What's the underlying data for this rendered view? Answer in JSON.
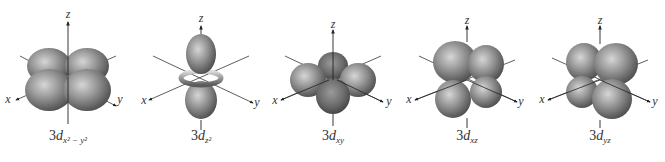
{
  "figure": {
    "colors": {
      "lobe_light": "#c4c4c4",
      "lobe_mid": "#8f8f8f",
      "lobe_dark": "#5a5a5a",
      "axis": "#222222",
      "text": "#333333"
    },
    "orbitals": [
      {
        "id": "dx2-y2",
        "prefix": "3",
        "letter": "d",
        "subscript": "x² − y²",
        "axes": {
          "x": "x",
          "y": "y",
          "z": "z"
        }
      },
      {
        "id": "dz2",
        "prefix": "3",
        "letter": "d",
        "subscript": "z²",
        "axes": {
          "x": "x",
          "y": "y",
          "z": "z"
        }
      },
      {
        "id": "dxy",
        "prefix": "3",
        "letter": "d",
        "subscript": "xy",
        "axes": {
          "x": "x",
          "y": "y",
          "z": "z"
        }
      },
      {
        "id": "dxz",
        "prefix": "3",
        "letter": "d",
        "subscript": "xz",
        "axes": {
          "x": "x",
          "y": "y",
          "z": "z"
        }
      },
      {
        "id": "dyz",
        "prefix": "3",
        "letter": "d",
        "subscript": "yz",
        "axes": {
          "x": "x",
          "y": "y",
          "z": "z"
        }
      }
    ]
  }
}
